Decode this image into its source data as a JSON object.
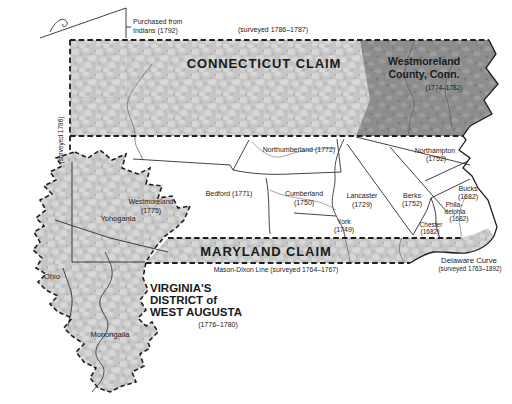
{
  "figure": {
    "width": 512,
    "height": 404,
    "background": "#ffffff"
  },
  "colors": {
    "claim_fill": "#c7c7c7",
    "claim_fill_light": "#d7d7d7",
    "claim_fill_dark": "#b6b6b6",
    "conn_county_fill": "#8d8d8d",
    "conn_county_light": "#9c9c9c",
    "conn_county_dark": "#7c7c7c",
    "claim_label": "#3d3d3d",
    "label": "#1a1a1a",
    "border": "#1f1f1f"
  },
  "claims": {
    "connecticut": {
      "label": "CONNECTICUT CLAIM",
      "survey_note": "(surveyed 1786–1787)"
    },
    "maryland": {
      "label": "MARYLAND CLAIM"
    },
    "virginia": {
      "name_line1": "VIRGINIA'S",
      "name_line2": "DISTRICT of",
      "name_line3": "WEST AUGUSTA",
      "date": "(1776–1780)"
    },
    "westmoreland_conn": {
      "name_line1": "Westmoreland",
      "name_line2": "County, Conn.",
      "date": "(1774–1782)"
    }
  },
  "counties": {
    "northumberland": {
      "label": "Northumberland (1772)"
    },
    "bedford": {
      "label": "Bedford (1771)"
    },
    "cumberland": {
      "name": "Cumberland",
      "date": "(1750)"
    },
    "york": {
      "name": "York",
      "date": "(1749)"
    },
    "lancaster": {
      "name": "Lancaster",
      "date": "(1729)"
    },
    "berks": {
      "name": "Berks",
      "date": "(1752)"
    },
    "northampton": {
      "name": "Northampton",
      "date": "(1752)"
    },
    "bucks": {
      "name": "Bucks",
      "date": "(1682)"
    },
    "philadelphia": {
      "name_line1": "Phila-",
      "name_line2": "delphia",
      "date": "(1682)"
    },
    "chester": {
      "name": "Chester",
      "date": "(1682)"
    },
    "westmoreland_pa": {
      "name": "Westmoreland",
      "date": "(1775)"
    },
    "yohogania": {
      "name": "Yohogania"
    },
    "ohio": {
      "name": "Ohio"
    },
    "monongalia": {
      "name": "Monongalia"
    }
  },
  "annotations": {
    "purchased_line1": "Purchased from",
    "purchased_line2": "Indians (1792)",
    "surveyed_west": "(surveyed 1786)",
    "mason_dixon": "Mason-Dixon Line (surveyed 1764–1767)",
    "delaware_curve_line1": "Delaware Curve",
    "delaware_curve_line2": "(surveyed 1763–1892)"
  }
}
